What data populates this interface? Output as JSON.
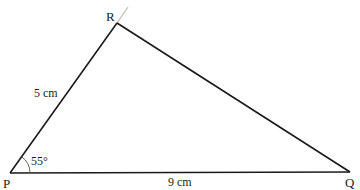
{
  "diagram": {
    "type": "triangle",
    "colors": {
      "line": "#1a1a1a",
      "extension": "#bbbbbb",
      "text": "#222222",
      "background": "#ffffff"
    },
    "vertices": {
      "P": {
        "label": "P",
        "x": 10,
        "y": 173
      },
      "Q": {
        "label": "Q",
        "x": 350,
        "y": 172
      },
      "R": {
        "label": "R",
        "x": 117,
        "y": 23
      }
    },
    "sides": {
      "PR": {
        "label": "5 cm",
        "length_cm": 5
      },
      "PQ": {
        "label": "9 cm",
        "length_cm": 9
      },
      "RQ": {
        "label": ""
      }
    },
    "angles": {
      "P": {
        "label": "55°",
        "degrees": 55
      }
    },
    "extension_line": {
      "from": "R",
      "direction": "along PR beyond R"
    }
  }
}
